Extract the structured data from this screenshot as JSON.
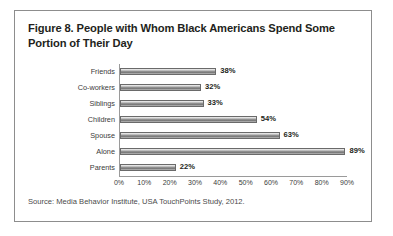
{
  "figure": {
    "title": "Figure 8. People with Whom Black Americans Spend Some Portion of Their Day",
    "source": "Source: Media Behavior Institute, USA TouchPoints Study, 2012."
  },
  "chart_data": {
    "type": "bar",
    "orientation": "horizontal",
    "title": "Figure 8. People with Whom Black Americans Spend Some Portion of Their Day",
    "categories": [
      "Friends",
      "Co-workers",
      "Siblings",
      "Children",
      "Spouse",
      "Alone",
      "Parents"
    ],
    "values": [
      38,
      32,
      33,
      54,
      63,
      89,
      22
    ],
    "value_labels": [
      "38%",
      "32%",
      "33%",
      "54%",
      "63%",
      "89%",
      "22%"
    ],
    "xlabel": "",
    "ylabel": "",
    "xlim": [
      0,
      90
    ],
    "xticks": [
      0,
      10,
      20,
      30,
      40,
      50,
      60,
      70,
      80,
      90
    ],
    "xtick_labels": [
      "0%",
      "10%",
      "20%",
      "30%",
      "40%",
      "50%",
      "60%",
      "70%",
      "80%",
      "90%"
    ],
    "grid": false,
    "legend": false,
    "bar_color": "#8f8f8f",
    "text_color": "#231f20"
  }
}
